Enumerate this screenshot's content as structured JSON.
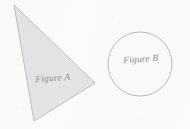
{
  "page": {
    "width": 190,
    "height": 129,
    "background_color": "#fbfbfa"
  },
  "figures": [
    {
      "id": "figure-a",
      "label": "Figure A",
      "shape": "triangle",
      "fill_color": "#e4e4e4",
      "stroke_color": "#b9b9b9",
      "stroke_width": 0.9,
      "points": "14,5 95,83 34,121",
      "vertices": [
        {
          "x": 14,
          "y": 5
        },
        {
          "x": 95,
          "y": 83
        },
        {
          "x": 34,
          "y": 121
        }
      ],
      "label_x": 53,
      "label_y": 81,
      "label_rotation": -4,
      "label_font_size": 9.5,
      "label_color": "#8c8c8c"
    },
    {
      "id": "figure-b",
      "label": "Figure B",
      "shape": "circle",
      "fill_color": "none",
      "stroke_color": "#b4b4b4",
      "stroke_width": 0.9,
      "center_x": 140,
      "center_y": 64,
      "radius": 32,
      "label_x": 141,
      "label_y": 62,
      "label_rotation": -4,
      "label_font_size": 9.5,
      "label_color": "#8c8c8c"
    }
  ]
}
